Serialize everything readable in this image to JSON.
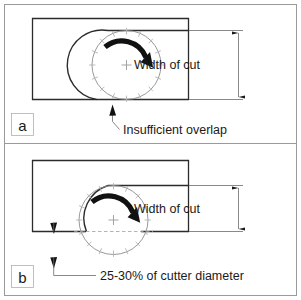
{
  "figure": {
    "outer_border_color": "#9a9a9a",
    "panel_divider_color": "#9a9a9a",
    "workpiece_line_color": "#2b2b2b",
    "cutter_outline_color": "#8d8d8d",
    "cut_path_color": "#2b2b2b",
    "tooth_mark_color": "#b3b3b3",
    "arrow_color": "#111111",
    "dimension_line_color": "#6b6b6b",
    "dashed_centerline_color": "#a0a0a0",
    "background_color": "#ffffff"
  },
  "panels": [
    {
      "id": "a",
      "panel_label": "a",
      "dimension_label": "Width of cut",
      "callout_label": "Insufficient overlap",
      "rotation_direction": "clockwise",
      "cutter_teeth_count": 16,
      "description": "Cutter tangent to lower edge of workpiece, insufficient radial overlap"
    },
    {
      "id": "b",
      "panel_label": "b",
      "dimension_label": "Width of cut",
      "callout_label": "25-30% of cutter diameter",
      "rotation_direction": "clockwise",
      "cutter_teeth_count": 16,
      "description": "Cutter centerline below lower edge of workpiece, correct radial overlap"
    }
  ]
}
